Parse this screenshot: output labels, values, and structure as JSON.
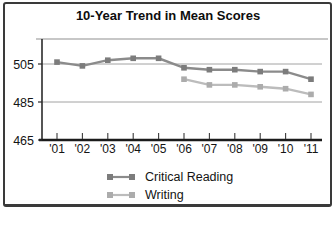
{
  "chart_data": {
    "type": "line",
    "title": "10-Year Trend in Mean Scores",
    "categories": [
      "'01",
      "'02",
      "'03",
      "'04",
      "'05",
      "'06",
      "'07",
      "'08",
      "'09",
      "'10",
      "'11"
    ],
    "series": [
      {
        "name": "Critical Reading",
        "values": [
          506,
          504,
          507,
          508,
          508,
          503,
          502,
          502,
          501,
          501,
          497
        ],
        "line_color": "#8b8b8b",
        "marker_color": "#7c7c7c"
      },
      {
        "name": "Writing",
        "values": [
          null,
          null,
          null,
          null,
          null,
          497,
          494,
          494,
          493,
          492,
          489
        ],
        "line_color": "#bcbcbc",
        "marker_color": "#acacac"
      }
    ],
    "yticks": [
      465,
      485,
      505
    ],
    "ylim": [
      465,
      518
    ],
    "xlabel": "",
    "ylabel": "",
    "grid": "horizontal gridlines at 485 and 505, top plot border line",
    "legend_position": "bottom",
    "axis_color": "#1b1b1b",
    "gridline_color": "#a2a2a2",
    "text_color": "#141414"
  }
}
